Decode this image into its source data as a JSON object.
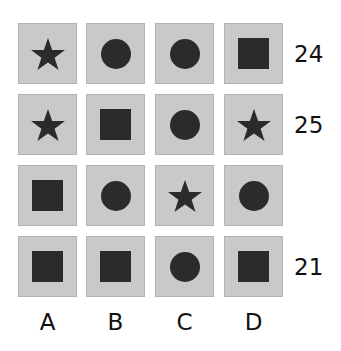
{
  "puzzle": {
    "grid": [
      [
        "star",
        "circle",
        "circle",
        "square"
      ],
      [
        "star",
        "square",
        "circle",
        "star"
      ],
      [
        "square",
        "circle",
        "star",
        "circle"
      ],
      [
        "square",
        "square",
        "circle",
        "square"
      ]
    ],
    "row_sums": [
      "24",
      "25",
      "",
      "21"
    ],
    "column_labels": [
      "A",
      "B",
      "C",
      "D"
    ],
    "colors": {
      "cell_background": "#c9c9c9",
      "cell_border": "#b2b2b2",
      "shape_fill": "#2b2b2b"
    }
  }
}
